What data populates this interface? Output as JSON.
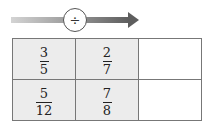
{
  "operation": {
    "symbol": "÷",
    "icon": "division-icon",
    "direction": "left-to-right"
  },
  "colors": {
    "arrow_start": "#d4d4d4",
    "arrow_end": "#5e5e5e",
    "cell_fill": "#ececec",
    "border": "#777777"
  },
  "grid": {
    "rows": [
      {
        "cells": [
          {
            "numerator": "3",
            "denominator": "5"
          },
          {
            "numerator": "2",
            "denominator": "7"
          },
          {
            "numerator": "",
            "denominator": ""
          }
        ]
      },
      {
        "cells": [
          {
            "numerator": "5",
            "denominator": "12"
          },
          {
            "numerator": "7",
            "denominator": "8"
          },
          {
            "numerator": "",
            "denominator": ""
          }
        ]
      }
    ]
  }
}
